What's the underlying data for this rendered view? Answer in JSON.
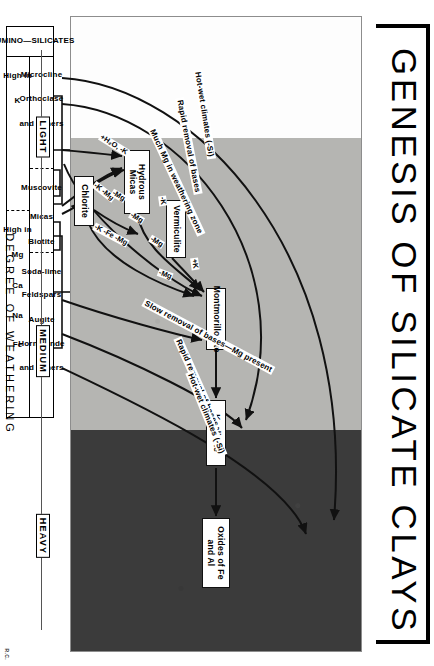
{
  "title": "GENESIS OF SILICATE CLAYS",
  "credit": "R.C.",
  "colors": {
    "dark_band": "#3b3b3b",
    "gray_band": "#b5b5b2",
    "white_band": "#fdfdfd",
    "line": "#111111"
  },
  "minerals": [
    {
      "id": "hydrous-micas",
      "label": "Hydrous\nMicas"
    },
    {
      "id": "vermiculite",
      "label": "Vermiculite"
    },
    {
      "id": "chlorite",
      "label": "Chlorite"
    },
    {
      "id": "montmorillonite",
      "label": "Montmorillonite"
    },
    {
      "id": "kaolinite",
      "label": "Kaolinite"
    },
    {
      "id": "oxides",
      "label": "Oxides of\nFe and Al"
    }
  ],
  "mineral_labels": {
    "hydrous_micas": "Hydrous Micas",
    "vermiculite": "Vermiculite",
    "chlorite": "Chlorite",
    "montmorillonite": "Montmorillonite",
    "kaolinite": "Kaolinite",
    "oxides": "Oxides of Fe and Al"
  },
  "path_labels": {
    "left_hot_wet": "Hot-wet climates (-Si)",
    "left_rapid": "Rapid removal of bases",
    "much_mg": "Much Mg in weathering zone",
    "slow_removal": "Slow removal of bases—Mg present",
    "right_rapid": "Rapid removal of bases",
    "right_hot_wet": "Hot-wet climates (-Si)"
  },
  "ion_labels": {
    "plus_h2o_minus_k": "+H₂O, -K",
    "minus_k_minus_mg": "-K -Mg",
    "minus_k_minus_fe_minus_mg": "-K -Fe -Mg",
    "minus_mg_a": "-Mg",
    "minus_mg_b": "-Mg",
    "minus_mg_c": "-Mg",
    "minus_mg_d": "-Mg",
    "plus_k_a": "+K",
    "plus_k_b": "+K",
    "minus_k_a": "-K",
    "minus_k_b": "-K"
  },
  "table": {
    "row_header": "ALUMINO—SILICATES",
    "groups": [
      {
        "composition": [
          "High  in",
          "K"
        ],
        "minerals": [
          "Microcline",
          "Orthoclase",
          "and Others"
        ],
        "mineral_group": "Muscovite"
      },
      {
        "composition": [
          "High  in",
          "Mg",
          "Ca",
          "Na",
          "Fe"
        ],
        "minerals": [
          "Micas",
          "Biotite"
        ],
        "mineral_group_2": [
          "Soda-lime",
          "Feldspars",
          "Augite",
          "Hornblende",
          "and Others"
        ]
      }
    ],
    "cells": {
      "micas_label": "Micas",
      "muscovite": "Muscovite",
      "biotite": "Biotite",
      "microcline": "Microcline",
      "orthoclase": "Orthoclase",
      "and_others_1": "and Others",
      "soda_lime": "Soda-lime",
      "feldspars": "Feldspars",
      "augite": "Augite",
      "hornblende": "Hornblende",
      "and_others_2": "and Others",
      "high_in_1": "High  in",
      "k_1": "K",
      "high_in_2": "High  in",
      "mg": "Mg",
      "ca": "Ca",
      "na": "Na",
      "fe": "Fe"
    }
  },
  "scale": {
    "caption": "DEGREE  OF  WEATHERING",
    "steps": [
      {
        "label": "LIGHT",
        "pos": 15
      },
      {
        "label": "MEDIUM",
        "pos": 52
      },
      {
        "label": "HEAVY",
        "pos": 84
      }
    ],
    "step_labels": {
      "light": "LIGHT",
      "medium": "MEDIUM",
      "heavy": "HEAVY"
    }
  }
}
